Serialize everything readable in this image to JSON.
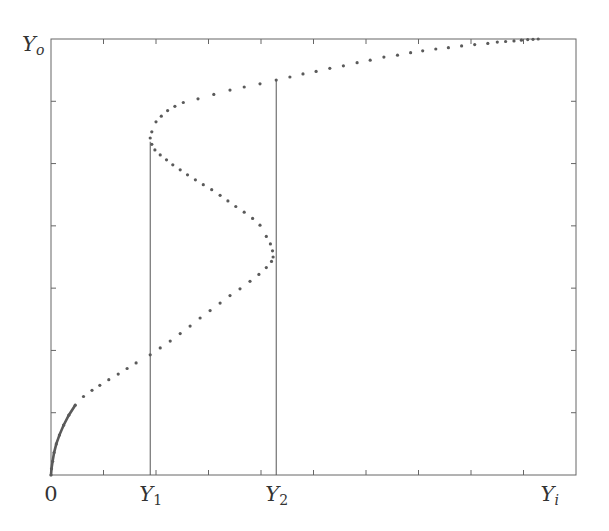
{
  "chart_data": {
    "type": "scatter",
    "title": "",
    "xlabel": "Y_i",
    "ylabel": "Y_o",
    "xlim": [
      0,
      10
    ],
    "ylim": [
      0,
      7
    ],
    "grid": false,
    "legend": null,
    "x_tick_count": 10,
    "y_tick_count": 7,
    "x_tick_labels": [
      {
        "x": 0,
        "base": "0",
        "sub": ""
      },
      {
        "x": 1.9,
        "base": "Y",
        "sub": "1"
      },
      {
        "x": 4.3,
        "base": "Y",
        "sub": "2"
      },
      {
        "x": 9.5,
        "base": "Y",
        "sub": "i"
      }
    ],
    "y_axis_label": {
      "base": "Y",
      "sub": "o"
    },
    "vertical_markers": [
      {
        "name": "Y1",
        "x": 1.89,
        "y_top": 5.35
      },
      {
        "name": "Y2",
        "x": 4.29,
        "y_top": 6.34
      }
    ],
    "series": [
      {
        "name": "bistable hysteresis curve",
        "style": "dotted",
        "color": "#555555",
        "points": [
          [
            0.0,
            0.0
          ],
          [
            0.01,
            0.1
          ],
          [
            0.03,
            0.22
          ],
          [
            0.06,
            0.36
          ],
          [
            0.1,
            0.5
          ],
          [
            0.16,
            0.64
          ],
          [
            0.24,
            0.8
          ],
          [
            0.34,
            0.96
          ],
          [
            0.46,
            1.12
          ],
          [
            0.62,
            1.26
          ],
          [
            0.78,
            1.36
          ],
          [
            0.93,
            1.44
          ],
          [
            1.1,
            1.53
          ],
          [
            1.28,
            1.62
          ],
          [
            1.45,
            1.71
          ],
          [
            1.62,
            1.8
          ],
          [
            1.89,
            1.93
          ],
          [
            2.08,
            2.04
          ],
          [
            2.27,
            2.15
          ],
          [
            2.46,
            2.27
          ],
          [
            2.65,
            2.39
          ],
          [
            2.84,
            2.52
          ],
          [
            3.03,
            2.64
          ],
          [
            3.22,
            2.76
          ],
          [
            3.41,
            2.88
          ],
          [
            3.6,
            2.99
          ],
          [
            3.79,
            3.11
          ],
          [
            3.96,
            3.22
          ],
          [
            4.1,
            3.33
          ],
          [
            4.2,
            3.43
          ],
          [
            4.23,
            3.5
          ],
          [
            4.22,
            3.6
          ],
          [
            4.18,
            3.71
          ],
          [
            4.1,
            3.83
          ],
          [
            3.98,
            4.01
          ],
          [
            3.84,
            4.12
          ],
          [
            3.68,
            4.22
          ],
          [
            3.52,
            4.31
          ],
          [
            3.37,
            4.4
          ],
          [
            3.22,
            4.49
          ],
          [
            3.06,
            4.58
          ],
          [
            2.9,
            4.66
          ],
          [
            2.75,
            4.74
          ],
          [
            2.6,
            4.82
          ],
          [
            2.46,
            4.9
          ],
          [
            2.32,
            4.98
          ],
          [
            2.2,
            5.06
          ],
          [
            2.08,
            5.14
          ],
          [
            1.98,
            5.22
          ],
          [
            1.92,
            5.31
          ],
          [
            1.89,
            5.41
          ],
          [
            1.92,
            5.51
          ],
          [
            2.0,
            5.67
          ],
          [
            2.1,
            5.76
          ],
          [
            2.22,
            5.85
          ],
          [
            2.36,
            5.92
          ],
          [
            2.52,
            5.98
          ],
          [
            2.8,
            6.04
          ],
          [
            3.1,
            6.11
          ],
          [
            3.41,
            6.18
          ],
          [
            3.68,
            6.23
          ],
          [
            3.98,
            6.28
          ],
          [
            4.29,
            6.34
          ],
          [
            4.55,
            6.39
          ],
          [
            4.8,
            6.44
          ],
          [
            5.05,
            6.48
          ],
          [
            5.31,
            6.53
          ],
          [
            5.57,
            6.57
          ],
          [
            5.83,
            6.62
          ],
          [
            6.08,
            6.66
          ],
          [
            6.34,
            6.71
          ],
          [
            6.6,
            6.74
          ],
          [
            6.85,
            6.78
          ],
          [
            7.08,
            6.81
          ],
          [
            7.33,
            6.84
          ],
          [
            7.57,
            6.86
          ],
          [
            7.82,
            6.89
          ],
          [
            8.07,
            6.91
          ],
          [
            8.32,
            6.93
          ],
          [
            8.5,
            6.95
          ],
          [
            8.66,
            6.96
          ],
          [
            8.82,
            6.97
          ],
          [
            8.96,
            6.98
          ],
          [
            9.08,
            6.99
          ],
          [
            9.18,
            6.995
          ],
          [
            9.28,
            7.0
          ]
        ]
      }
    ]
  },
  "colors": {
    "axis": "#666666",
    "marker_line": "#555555",
    "dots": "#5a5a5a",
    "background": "#ffffff"
  }
}
